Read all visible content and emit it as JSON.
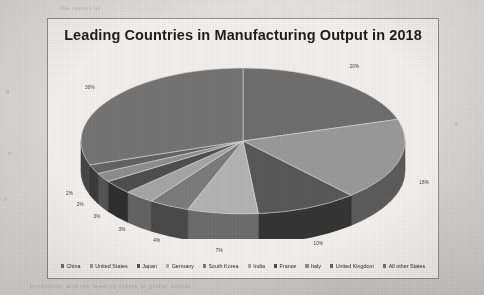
{
  "chart_data": {
    "type": "pie",
    "title": "Leading Countries in Manufacturing Output in 2018",
    "xlabel": "",
    "ylabel": "",
    "legend_position": "bottom",
    "grid": false,
    "three_d": true,
    "categories": [
      "China",
      "United States",
      "Japan",
      "Germany",
      "South Korea",
      "India",
      "France",
      "Italy",
      "United Kingdom",
      "All other States"
    ],
    "values": [
      20,
      18,
      10,
      7,
      4,
      3,
      3,
      2,
      2,
      30
    ],
    "labels": [
      "20%",
      "18%",
      "10%",
      "7%",
      "4%",
      "3%",
      "3%",
      "2%",
      "2%",
      "30%"
    ],
    "colors": [
      "#6f6f6f",
      "#9a9a9a",
      "#585858",
      "#b4b4b4",
      "#7c7c7c",
      "#a6a6a6",
      "#4f4f4f",
      "#8e8e8e",
      "#636363",
      "#747474"
    ],
    "slices": [
      {
        "name": "China",
        "value": 20,
        "label": "20%",
        "color": "#6f6f6f"
      },
      {
        "name": "United States",
        "value": 18,
        "label": "18%",
        "color": "#9a9a9a"
      },
      {
        "name": "Japan",
        "value": 10,
        "label": "10%",
        "color": "#585858"
      },
      {
        "name": "Germany",
        "value": 7,
        "label": "7%",
        "color": "#b4b4b4"
      },
      {
        "name": "South Korea",
        "value": 4,
        "label": "4%",
        "color": "#7c7c7c"
      },
      {
        "name": "India",
        "value": 3,
        "label": "3%",
        "color": "#a6a6a6"
      },
      {
        "name": "France",
        "value": 3,
        "label": "3%",
        "color": "#4f4f4f"
      },
      {
        "name": "Italy",
        "value": 2,
        "label": "2%",
        "color": "#8e8e8e"
      },
      {
        "name": "United Kingdom",
        "value": 2,
        "label": "2%",
        "color": "#636363"
      },
      {
        "name": "All other States",
        "value": 30,
        "label": "30%",
        "color": "#747474"
      }
    ]
  },
  "legend": {
    "items": [
      {
        "label": "China",
        "color": "#6f6f6f"
      },
      {
        "label": "United States",
        "color": "#9a9a9a"
      },
      {
        "label": "Japan",
        "color": "#585858"
      },
      {
        "label": "Germany",
        "color": "#b4b4b4"
      },
      {
        "label": "South Korea",
        "color": "#7c7c7c"
      },
      {
        "label": "India",
        "color": "#a6a6a6"
      },
      {
        "label": "France",
        "color": "#4f4f4f"
      },
      {
        "label": "Italy",
        "color": "#8e8e8e"
      },
      {
        "label": "United Kingdom",
        "color": "#636363"
      },
      {
        "label": "All other States",
        "color": "#747474"
      }
    ]
  },
  "page": {
    "background_color": "#e9e8e6",
    "frame_color": "#8d8b88"
  }
}
